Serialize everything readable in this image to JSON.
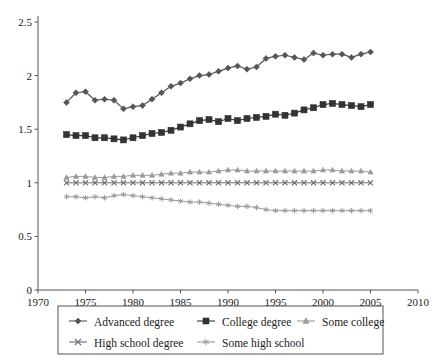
{
  "chart_data": {
    "type": "line",
    "title": "",
    "xlabel": "",
    "ylabel": "",
    "xlim": [
      1970,
      2010
    ],
    "ylim": [
      0,
      2.5
    ],
    "xticks": [
      1970,
      1975,
      1980,
      1985,
      1990,
      1995,
      2000,
      2005,
      2010
    ],
    "yticks": [
      0,
      0.5,
      1,
      1.5,
      2,
      2.5
    ],
    "xtick_labels": [
      "1970",
      "1975",
      "1980",
      "1985",
      "1990",
      "1995",
      "2000",
      "2005",
      "2010"
    ],
    "ytick_labels": [
      "0",
      "0.5",
      "1",
      "1.5",
      "2",
      "2.5"
    ],
    "grid": false,
    "legend_position": "bottom",
    "x": [
      1973,
      1974,
      1975,
      1976,
      1977,
      1978,
      1979,
      1980,
      1981,
      1982,
      1983,
      1984,
      1985,
      1986,
      1987,
      1988,
      1989,
      1990,
      1991,
      1992,
      1993,
      1994,
      1995,
      1996,
      1997,
      1998,
      1999,
      2000,
      2001,
      2002,
      2003,
      2004,
      2005
    ],
    "series": [
      {
        "name": "Advanced degree",
        "marker": "diamond",
        "color": "#555555",
        "values": [
          1.75,
          1.84,
          1.85,
          1.77,
          1.78,
          1.77,
          1.69,
          1.71,
          1.72,
          1.78,
          1.84,
          1.9,
          1.93,
          1.97,
          2.0,
          2.01,
          2.04,
          2.07,
          2.09,
          2.06,
          2.08,
          2.16,
          2.18,
          2.19,
          2.17,
          2.15,
          2.21,
          2.19,
          2.2,
          2.2,
          2.17,
          2.2,
          2.22
        ]
      },
      {
        "name": "College degree",
        "marker": "square",
        "color": "#333333",
        "values": [
          1.45,
          1.44,
          1.44,
          1.42,
          1.42,
          1.41,
          1.4,
          1.42,
          1.44,
          1.46,
          1.47,
          1.49,
          1.52,
          1.55,
          1.58,
          1.59,
          1.57,
          1.6,
          1.58,
          1.6,
          1.61,
          1.62,
          1.64,
          1.63,
          1.65,
          1.68,
          1.7,
          1.73,
          1.74,
          1.73,
          1.72,
          1.71,
          1.73
        ]
      },
      {
        "name": "Some college",
        "marker": "triangle",
        "color": "#9a9a9a",
        "values": [
          1.05,
          1.06,
          1.06,
          1.05,
          1.05,
          1.06,
          1.06,
          1.07,
          1.07,
          1.07,
          1.08,
          1.09,
          1.09,
          1.1,
          1.1,
          1.1,
          1.11,
          1.12,
          1.12,
          1.11,
          1.11,
          1.11,
          1.11,
          1.11,
          1.11,
          1.11,
          1.11,
          1.12,
          1.12,
          1.11,
          1.11,
          1.11,
          1.1
        ]
      },
      {
        "name": "High school degree",
        "marker": "cross",
        "color": "#6f6f6f",
        "values": [
          1.0,
          1.0,
          1.0,
          1.0,
          1.0,
          1.0,
          1.0,
          1.0,
          1.0,
          1.0,
          1.0,
          1.0,
          1.0,
          1.0,
          1.0,
          1.0,
          1.0,
          1.0,
          1.0,
          1.0,
          1.0,
          1.0,
          1.0,
          1.0,
          1.0,
          1.0,
          1.0,
          1.0,
          1.0,
          1.0,
          1.0,
          1.0,
          1.0
        ]
      },
      {
        "name": "Some high school",
        "marker": "asterisk",
        "color": "#9a9a9a",
        "values": [
          0.87,
          0.87,
          0.86,
          0.87,
          0.86,
          0.88,
          0.89,
          0.88,
          0.87,
          0.86,
          0.85,
          0.84,
          0.83,
          0.82,
          0.82,
          0.81,
          0.8,
          0.79,
          0.78,
          0.78,
          0.77,
          0.75,
          0.74,
          0.74,
          0.74,
          0.74,
          0.74,
          0.74,
          0.74,
          0.74,
          0.74,
          0.74,
          0.74
        ]
      }
    ]
  },
  "legend": {
    "entries": [
      {
        "label": "Advanced degree"
      },
      {
        "label": "College degree"
      },
      {
        "label": "Some college"
      },
      {
        "label": "High school degree"
      },
      {
        "label": "Some high school"
      }
    ]
  }
}
